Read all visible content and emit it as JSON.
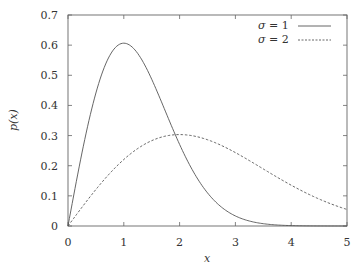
{
  "chart_data": {
    "type": "line",
    "title": "",
    "xlabel": "x",
    "ylabel": "p(x)",
    "xlim": [
      0,
      5
    ],
    "ylim": [
      0,
      0.7
    ],
    "xticks": [
      0,
      1,
      2,
      3,
      4,
      5
    ],
    "yticks": [
      0,
      0.1,
      0.2,
      0.3,
      0.4,
      0.5,
      0.6,
      0.7
    ],
    "xtick_labels": [
      "0",
      "1",
      "2",
      "3",
      "4",
      "5"
    ],
    "ytick_labels": [
      "0",
      "0.1",
      "0.2",
      "0.3",
      "0.4",
      "0.5",
      "0.6",
      "0.7"
    ],
    "grid": false,
    "legend_position": "upper right",
    "series": [
      {
        "name": "σ = 1",
        "sigma": 1,
        "style": "solid",
        "color": "#555555",
        "x": [
          0,
          0.25,
          0.5,
          0.75,
          1,
          1.25,
          1.5,
          2,
          2.5,
          3,
          3.5,
          4,
          4.5,
          5
        ],
        "values": [
          0,
          0.242,
          0.441,
          0.566,
          0.607,
          0.573,
          0.487,
          0.271,
          0.11,
          0.033,
          0.008,
          0.001,
          0.0001,
          0
        ]
      },
      {
        "name": "σ = 2",
        "sigma": 2,
        "style": "dashed",
        "color": "#555555",
        "x": [
          0,
          0.5,
          1,
          1.5,
          2,
          2.5,
          3,
          3.5,
          4,
          4.5,
          5
        ],
        "values": [
          0,
          0.121,
          0.221,
          0.283,
          0.303,
          0.287,
          0.243,
          0.19,
          0.135,
          0.09,
          0.055
        ]
      }
    ]
  },
  "legend": {
    "items": [
      {
        "symbol": "σ",
        "label": " = 1"
      },
      {
        "symbol": "σ",
        "label": " = 2"
      }
    ]
  },
  "axes": {
    "xlabel": "x",
    "ylabel": "p(x)"
  }
}
